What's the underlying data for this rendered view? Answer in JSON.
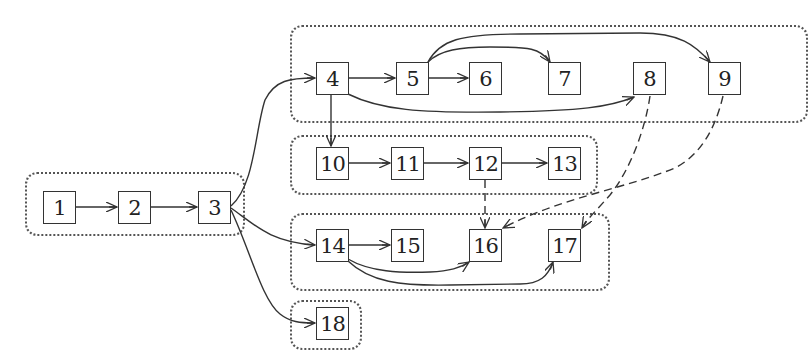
{
  "diagram": {
    "type": "directed-graph",
    "clusters": [
      {
        "id": "A",
        "nodes": [
          "1",
          "2",
          "3"
        ],
        "box": [
          25,
          172,
          220,
          64
        ]
      },
      {
        "id": "B",
        "nodes": [
          "4",
          "5",
          "6",
          "7",
          "8",
          "9"
        ],
        "box": [
          290,
          25,
          518,
          98
        ]
      },
      {
        "id": "C",
        "nodes": [
          "10",
          "11",
          "12",
          "13"
        ],
        "box": [
          290,
          135,
          308,
          60
        ]
      },
      {
        "id": "D",
        "nodes": [
          "14",
          "15",
          "16",
          "17"
        ],
        "box": [
          290,
          213,
          320,
          78
        ]
      },
      {
        "id": "E",
        "nodes": [
          "18"
        ],
        "box": [
          290,
          300,
          72,
          50
        ]
      }
    ],
    "nodes": [
      {
        "id": "n1",
        "label": "1",
        "x": 43,
        "y": 191
      },
      {
        "id": "n2",
        "label": "2",
        "x": 118,
        "y": 191
      },
      {
        "id": "n3",
        "label": "3",
        "x": 198,
        "y": 191
      },
      {
        "id": "n4",
        "label": "4",
        "x": 316,
        "y": 62
      },
      {
        "id": "n5",
        "label": "5",
        "x": 396,
        "y": 62
      },
      {
        "id": "n6",
        "label": "6",
        "x": 469,
        "y": 62
      },
      {
        "id": "n7",
        "label": "7",
        "x": 548,
        "y": 62
      },
      {
        "id": "n8",
        "label": "8",
        "x": 633,
        "y": 62
      },
      {
        "id": "n9",
        "label": "9",
        "x": 708,
        "y": 62
      },
      {
        "id": "n10",
        "label": "10",
        "x": 316,
        "y": 147
      },
      {
        "id": "n11",
        "label": "11",
        "x": 391,
        "y": 147
      },
      {
        "id": "n12",
        "label": "12",
        "x": 469,
        "y": 147
      },
      {
        "id": "n13",
        "label": "13",
        "x": 548,
        "y": 147
      },
      {
        "id": "n14",
        "label": "14",
        "x": 316,
        "y": 229
      },
      {
        "id": "n15",
        "label": "15",
        "x": 391,
        "y": 229
      },
      {
        "id": "n16",
        "label": "16",
        "x": 469,
        "y": 229
      },
      {
        "id": "n17",
        "label": "17",
        "x": 548,
        "y": 229
      },
      {
        "id": "n18",
        "label": "18",
        "x": 316,
        "y": 307
      }
    ],
    "edges": [
      {
        "from": "1",
        "to": "2",
        "style": "solid"
      },
      {
        "from": "2",
        "to": "3",
        "style": "solid"
      },
      {
        "from": "3",
        "to": "4",
        "style": "solid"
      },
      {
        "from": "3",
        "to": "14",
        "style": "solid"
      },
      {
        "from": "3",
        "to": "18",
        "style": "solid"
      },
      {
        "from": "4",
        "to": "5",
        "style": "solid"
      },
      {
        "from": "4",
        "to": "8",
        "style": "solid"
      },
      {
        "from": "4",
        "to": "10",
        "style": "solid"
      },
      {
        "from": "5",
        "to": "6",
        "style": "solid"
      },
      {
        "from": "5",
        "to": "7",
        "style": "solid"
      },
      {
        "from": "5",
        "to": "9",
        "style": "solid"
      },
      {
        "from": "10",
        "to": "11",
        "style": "solid"
      },
      {
        "from": "11",
        "to": "12",
        "style": "solid"
      },
      {
        "from": "12",
        "to": "13",
        "style": "solid"
      },
      {
        "from": "12",
        "to": "16",
        "style": "dashed"
      },
      {
        "from": "8",
        "to": "17",
        "style": "dashed"
      },
      {
        "from": "9",
        "to": "16",
        "style": "dashed"
      },
      {
        "from": "14",
        "to": "15",
        "style": "solid"
      },
      {
        "from": "14",
        "to": "16",
        "style": "solid"
      },
      {
        "from": "14",
        "to": "17",
        "style": "solid"
      }
    ]
  },
  "labels": {
    "n1": "1",
    "n2": "2",
    "n3": "3",
    "n4": "4",
    "n5": "5",
    "n6": "6",
    "n7": "7",
    "n8": "8",
    "n9": "9",
    "n10": "10",
    "n11": "11",
    "n12": "12",
    "n13": "13",
    "n14": "14",
    "n15": "15",
    "n16": "16",
    "n17": "17",
    "n18": "18"
  },
  "colors": {
    "stroke": "#333333",
    "cluster_border": "#555555",
    "background": "#ffffff"
  }
}
